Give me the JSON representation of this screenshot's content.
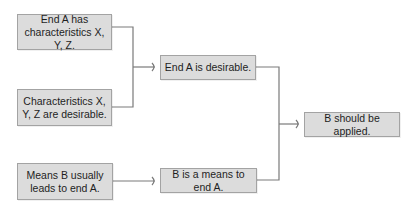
{
  "diagram": {
    "type": "argument-map",
    "colors": {
      "box_fill": "#dcdcdc",
      "box_border": "#a3a3a3",
      "connector": "#7a7a7a",
      "text": "#1e1e1e"
    },
    "nodes": [
      {
        "id": "p1",
        "label": "End A has characteristics X, Y, Z."
      },
      {
        "id": "p2",
        "label": "Characteristics X, Y, Z are desirable."
      },
      {
        "id": "c1",
        "label": "End A is desirable."
      },
      {
        "id": "p3",
        "label": "Means B usually leads to end A."
      },
      {
        "id": "c2",
        "label": "B is a means to end A."
      },
      {
        "id": "conclusion",
        "label": "B should be applied."
      }
    ],
    "edges": [
      {
        "from": [
          "p1",
          "p2"
        ],
        "to": "c1"
      },
      {
        "from": [
          "p3"
        ],
        "to": "c2"
      },
      {
        "from": [
          "c1",
          "c2"
        ],
        "to": "conclusion"
      }
    ]
  }
}
